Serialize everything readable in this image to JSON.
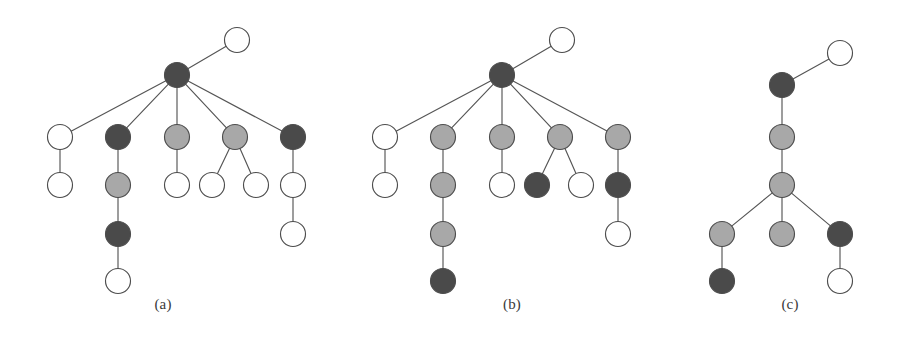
{
  "figure": {
    "background_color": "#ffffff",
    "node_radius": 12.5,
    "edge_color": "#555555",
    "node_stroke_color": "#4d4d4d",
    "palette": {
      "white": "#ffffff",
      "light_gray": "#a8a8a8",
      "dark_gray": "#4a4a4a"
    }
  },
  "captions": [
    {
      "label": "(a)",
      "x": 163,
      "y": 303
    },
    {
      "label": "(b)",
      "x": 512,
      "y": 303
    },
    {
      "label": "(c)",
      "x": 790,
      "y": 303
    }
  ],
  "panels": [
    {
      "id": "panel-a",
      "caption": "(a)",
      "nodes": [
        {
          "id": "a0",
          "x": 177,
          "y": 75,
          "fill": "dark_gray",
          "role": "root"
        },
        {
          "id": "a1",
          "x": 237,
          "y": 40,
          "fill": "white",
          "role": "leaf"
        },
        {
          "id": "a2",
          "x": 60,
          "y": 137,
          "fill": "white",
          "role": "child"
        },
        {
          "id": "a3",
          "x": 118,
          "y": 137,
          "fill": "dark_gray",
          "role": "child"
        },
        {
          "id": "a4",
          "x": 177,
          "y": 137,
          "fill": "light_gray",
          "role": "child"
        },
        {
          "id": "a5",
          "x": 235,
          "y": 137,
          "fill": "light_gray",
          "role": "child"
        },
        {
          "id": "a6",
          "x": 293,
          "y": 137,
          "fill": "dark_gray",
          "role": "child"
        },
        {
          "id": "a7",
          "x": 60,
          "y": 185,
          "fill": "white",
          "role": "leaf"
        },
        {
          "id": "a8",
          "x": 118,
          "y": 185,
          "fill": "light_gray",
          "role": "child"
        },
        {
          "id": "a9",
          "x": 177,
          "y": 185,
          "fill": "white",
          "role": "leaf"
        },
        {
          "id": "a10",
          "x": 212,
          "y": 185,
          "fill": "white",
          "role": "leaf"
        },
        {
          "id": "a11",
          "x": 256,
          "y": 185,
          "fill": "white",
          "role": "leaf"
        },
        {
          "id": "a12",
          "x": 293,
          "y": 185,
          "fill": "white",
          "role": "child"
        },
        {
          "id": "a13",
          "x": 118,
          "y": 234,
          "fill": "dark_gray",
          "role": "child"
        },
        {
          "id": "a14",
          "x": 293,
          "y": 234,
          "fill": "white",
          "role": "leaf"
        },
        {
          "id": "a15",
          "x": 118,
          "y": 281,
          "fill": "white",
          "role": "leaf"
        }
      ],
      "edges": [
        [
          "a0",
          "a1"
        ],
        [
          "a0",
          "a2"
        ],
        [
          "a0",
          "a3"
        ],
        [
          "a0",
          "a4"
        ],
        [
          "a0",
          "a5"
        ],
        [
          "a0",
          "a6"
        ],
        [
          "a2",
          "a7"
        ],
        [
          "a3",
          "a8"
        ],
        [
          "a4",
          "a9"
        ],
        [
          "a5",
          "a10"
        ],
        [
          "a5",
          "a11"
        ],
        [
          "a6",
          "a12"
        ],
        [
          "a8",
          "a13"
        ],
        [
          "a12",
          "a14"
        ],
        [
          "a13",
          "a15"
        ]
      ]
    },
    {
      "id": "panel-b",
      "caption": "(b)",
      "nodes": [
        {
          "id": "b0",
          "x": 502,
          "y": 75,
          "fill": "dark_gray",
          "role": "root"
        },
        {
          "id": "b1",
          "x": 562,
          "y": 40,
          "fill": "white",
          "role": "leaf"
        },
        {
          "id": "b2",
          "x": 385,
          "y": 137,
          "fill": "white",
          "role": "child"
        },
        {
          "id": "b3",
          "x": 443,
          "y": 137,
          "fill": "light_gray",
          "role": "child"
        },
        {
          "id": "b4",
          "x": 502,
          "y": 137,
          "fill": "light_gray",
          "role": "child"
        },
        {
          "id": "b5",
          "x": 560,
          "y": 137,
          "fill": "light_gray",
          "role": "child"
        },
        {
          "id": "b6",
          "x": 618,
          "y": 137,
          "fill": "light_gray",
          "role": "child"
        },
        {
          "id": "b7",
          "x": 385,
          "y": 185,
          "fill": "white",
          "role": "leaf"
        },
        {
          "id": "b8",
          "x": 443,
          "y": 185,
          "fill": "light_gray",
          "role": "child"
        },
        {
          "id": "b9",
          "x": 502,
          "y": 185,
          "fill": "white",
          "role": "leaf"
        },
        {
          "id": "b10",
          "x": 537,
          "y": 185,
          "fill": "dark_gray",
          "role": "leaf"
        },
        {
          "id": "b11",
          "x": 581,
          "y": 185,
          "fill": "white",
          "role": "leaf"
        },
        {
          "id": "b12",
          "x": 618,
          "y": 185,
          "fill": "dark_gray",
          "role": "child"
        },
        {
          "id": "b13",
          "x": 443,
          "y": 234,
          "fill": "light_gray",
          "role": "child"
        },
        {
          "id": "b14",
          "x": 618,
          "y": 234,
          "fill": "white",
          "role": "leaf"
        },
        {
          "id": "b15",
          "x": 443,
          "y": 281,
          "fill": "dark_gray",
          "role": "leaf"
        }
      ],
      "edges": [
        [
          "b0",
          "b1"
        ],
        [
          "b0",
          "b2"
        ],
        [
          "b0",
          "b3"
        ],
        [
          "b0",
          "b4"
        ],
        [
          "b0",
          "b5"
        ],
        [
          "b0",
          "b6"
        ],
        [
          "b2",
          "b7"
        ],
        [
          "b3",
          "b8"
        ],
        [
          "b4",
          "b9"
        ],
        [
          "b5",
          "b10"
        ],
        [
          "b5",
          "b11"
        ],
        [
          "b6",
          "b12"
        ],
        [
          "b8",
          "b13"
        ],
        [
          "b12",
          "b14"
        ],
        [
          "b13",
          "b15"
        ]
      ]
    },
    {
      "id": "panel-c",
      "caption": "(c)",
      "nodes": [
        {
          "id": "c0",
          "x": 782,
          "y": 85,
          "fill": "dark_gray",
          "role": "root"
        },
        {
          "id": "c1",
          "x": 840,
          "y": 53,
          "fill": "white",
          "role": "leaf"
        },
        {
          "id": "c2",
          "x": 782,
          "y": 137,
          "fill": "light_gray",
          "role": "child"
        },
        {
          "id": "c3",
          "x": 782,
          "y": 185,
          "fill": "light_gray",
          "role": "child"
        },
        {
          "id": "c4",
          "x": 722,
          "y": 234,
          "fill": "light_gray",
          "role": "child"
        },
        {
          "id": "c5",
          "x": 782,
          "y": 234,
          "fill": "light_gray",
          "role": "leaf"
        },
        {
          "id": "c6",
          "x": 840,
          "y": 234,
          "fill": "dark_gray",
          "role": "child"
        },
        {
          "id": "c7",
          "x": 722,
          "y": 281,
          "fill": "dark_gray",
          "role": "leaf"
        },
        {
          "id": "c8",
          "x": 840,
          "y": 281,
          "fill": "white",
          "role": "leaf"
        }
      ],
      "edges": [
        [
          "c0",
          "c1"
        ],
        [
          "c0",
          "c2"
        ],
        [
          "c2",
          "c3"
        ],
        [
          "c3",
          "c4"
        ],
        [
          "c3",
          "c5"
        ],
        [
          "c3",
          "c6"
        ],
        [
          "c4",
          "c7"
        ],
        [
          "c6",
          "c8"
        ]
      ]
    }
  ]
}
